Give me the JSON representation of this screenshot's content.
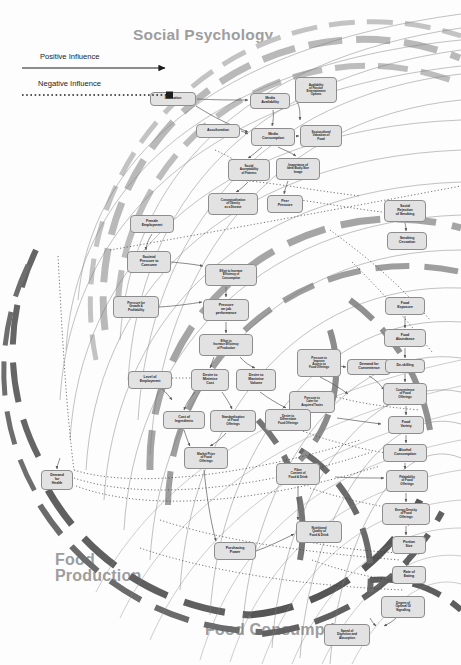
{
  "zones": [
    {
      "id": "social-psychology",
      "label": "Social Psychology"
    },
    {
      "id": "food-production",
      "label": "Food\nProduction"
    },
    {
      "id": "food-consumption",
      "label": "Food Consumption"
    }
  ],
  "zone_labels": {
    "social_psychology": "Social Psychology",
    "food_production_line1": "Food",
    "food_production_line2": "Production",
    "food_consumption": "Food Consumption"
  },
  "legend": {
    "positive_label": "Positive Influence",
    "negative_label": "Negative Influence",
    "positive_style": "solid-arrow",
    "negative_style": "dotted-square",
    "line_color": "#222222"
  },
  "colors": {
    "node_fill": "#e2e2e2",
    "node_stroke": "#8d8d8d",
    "node_text": "#2b2b2b",
    "zone_text": "#9e9e9e",
    "arc_light": "#b7b7b7",
    "arc_mid": "#9a9a9a",
    "arc_dark": "#6e6e6e",
    "link_line": "#6d6d6d",
    "background": "#fdfdfd"
  },
  "nodes": [
    {
      "id": "education",
      "label": "Education",
      "x": 150,
      "y": 92,
      "w": 46,
      "h": 14
    },
    {
      "id": "media-availability",
      "label": "Media\nAvailability",
      "x": 250,
      "y": 93,
      "w": 40,
      "h": 16
    },
    {
      "id": "availability-passive-entertainment",
      "label": "Availability\nof Passive\nEntertainment\nOptions",
      "x": 295,
      "y": 77,
      "w": 42,
      "h": 26
    },
    {
      "id": "acculturation",
      "label": "Acculturation",
      "x": 196,
      "y": 124,
      "w": 44,
      "h": 14
    },
    {
      "id": "media-consumption",
      "label": "Media\nConsumption",
      "x": 251,
      "y": 128,
      "w": 44,
      "h": 18
    },
    {
      "id": "sociocultural-valuation-food",
      "label": "Sociocultural\nValuation of\nFood",
      "x": 300,
      "y": 125,
      "w": 42,
      "h": 22
    },
    {
      "id": "social-acceptability-fatness",
      "label": "Social\nAcceptability\nof Fatness",
      "x": 228,
      "y": 159,
      "w": 42,
      "h": 22
    },
    {
      "id": "importance-ideal-body-size",
      "label": "Importance of\nIdeal Body-Size\nImage",
      "x": 276,
      "y": 158,
      "w": 44,
      "h": 22
    },
    {
      "id": "conceptualisation-obesity-disease",
      "label": "Conceptualisation\nof Obesity\nas a Disease",
      "x": 208,
      "y": 193,
      "w": 50,
      "h": 22
    },
    {
      "id": "peer-pressure",
      "label": "Peer\nPressure",
      "x": 267,
      "y": 195,
      "w": 36,
      "h": 18
    },
    {
      "id": "social-rejection-smoking",
      "label": "Social\nRejection\nof Smoking",
      "x": 384,
      "y": 200,
      "w": 42,
      "h": 22
    },
    {
      "id": "smoking-cessation",
      "label": "Smoking\nCessation",
      "x": 387,
      "y": 232,
      "w": 40,
      "h": 18
    },
    {
      "id": "female-employment",
      "label": "Female\nEmployment",
      "x": 130,
      "y": 215,
      "w": 44,
      "h": 18
    },
    {
      "id": "societal-pressure-consume",
      "label": "Societal\nPressure to\nConsume",
      "x": 127,
      "y": 251,
      "w": 44,
      "h": 22
    },
    {
      "id": "effort-increase-efficiency-consumption",
      "label": "Effort to Increase\nEfficiency of\nConsumption",
      "x": 205,
      "y": 264,
      "w": 52,
      "h": 22
    },
    {
      "id": "pressure-growth-profitability",
      "label": "Pressure for\nGrowth &\nProfitability",
      "x": 113,
      "y": 296,
      "w": 46,
      "h": 22
    },
    {
      "id": "pressure-job-performance",
      "label": "Pressure\non job\nperformance",
      "x": 203,
      "y": 299,
      "w": 46,
      "h": 22
    },
    {
      "id": "effort-increase-efficiency-production",
      "label": "Effort to\nIncrease Efficiency\nof Production",
      "x": 199,
      "y": 334,
      "w": 54,
      "h": 22
    },
    {
      "id": "pressure-improve-access-food",
      "label": "Pressure to\nImprove\nAccess to\nFood Offerings",
      "x": 297,
      "y": 349,
      "w": 44,
      "h": 28
    },
    {
      "id": "demand-convenience",
      "label": "Demand for\nConvenience",
      "x": 347,
      "y": 359,
      "w": 44,
      "h": 16
    },
    {
      "id": "pressure-cater-acquired-tastes",
      "label": "Pressure to\nCater for\nAcquired Tastes",
      "x": 289,
      "y": 391,
      "w": 46,
      "h": 22
    },
    {
      "id": "level-employment",
      "label": "Level of\nEmployment",
      "x": 128,
      "y": 371,
      "w": 44,
      "h": 18
    },
    {
      "id": "desire-minimise-cost",
      "label": "Desire to\nMinimise\nCost",
      "x": 191,
      "y": 369,
      "w": 38,
      "h": 22
    },
    {
      "id": "desire-maximise-volume",
      "label": "Desire to\nMaximise\nVolume",
      "x": 236,
      "y": 369,
      "w": 40,
      "h": 22
    },
    {
      "id": "cost-ingredients",
      "label": "Cost of\nIngredients",
      "x": 163,
      "y": 411,
      "w": 42,
      "h": 18
    },
    {
      "id": "standardisation-food-offerings",
      "label": "Standardisation\nof Food\nOfferings",
      "x": 210,
      "y": 410,
      "w": 46,
      "h": 22
    },
    {
      "id": "desire-differentiate-food-offerings",
      "label": "Desire to\nDifferentiate\nFood Offerings",
      "x": 265,
      "y": 409,
      "w": 46,
      "h": 22
    },
    {
      "id": "market-price-food-offerings",
      "label": "Market Price\nof Food\nOfferings",
      "x": 184,
      "y": 447,
      "w": 44,
      "h": 22
    },
    {
      "id": "fibre-content-food-drink",
      "label": "Fibre\nContent of\nFood & Drink",
      "x": 276,
      "y": 463,
      "w": 44,
      "h": 22
    },
    {
      "id": "demand-health",
      "label": "Demand\nfor\nHealth",
      "x": 41,
      "y": 470,
      "w": 32,
      "h": 20
    },
    {
      "id": "food-exposure",
      "label": "Food\nExposure",
      "x": 385,
      "y": 297,
      "w": 40,
      "h": 18
    },
    {
      "id": "food-abundance",
      "label": "Food\nAbundance",
      "x": 384,
      "y": 329,
      "w": 42,
      "h": 18
    },
    {
      "id": "de-skilling",
      "label": "De-skilling",
      "x": 385,
      "y": 359,
      "w": 40,
      "h": 14
    },
    {
      "id": "convenience-food-offerings",
      "label": "Convenience\nof Food\nOfferings",
      "x": 383,
      "y": 383,
      "w": 44,
      "h": 22
    },
    {
      "id": "food-variety",
      "label": "Food\nVariety",
      "x": 388,
      "y": 416,
      "w": 36,
      "h": 18
    },
    {
      "id": "alcohol-consumption",
      "label": "Alcohol\nConsumption",
      "x": 383,
      "y": 444,
      "w": 44,
      "h": 18
    },
    {
      "id": "palatability-food-offerings",
      "label": "Palatability\nof Food\nOfferings",
      "x": 386,
      "y": 470,
      "w": 42,
      "h": 22
    },
    {
      "id": "energy-density-food-offerings",
      "label": "Energy Density\nof Food\nOfferings",
      "x": 382,
      "y": 503,
      "w": 48,
      "h": 22
    },
    {
      "id": "portion-size",
      "label": "Portion\nSize",
      "x": 392,
      "y": 536,
      "w": 34,
      "h": 18
    },
    {
      "id": "rate-eating",
      "label": "Rate of\nEating",
      "x": 392,
      "y": 566,
      "w": 34,
      "h": 18
    },
    {
      "id": "nutritional-quality-food-drink",
      "label": "Nutritional\nQuality of\nFood & Drink",
      "x": 296,
      "y": 521,
      "w": 46,
      "h": 22
    },
    {
      "id": "purchasing-power",
      "label": "Purchasing\nPower",
      "x": 214,
      "y": 542,
      "w": 42,
      "h": 18
    },
    {
      "id": "degree-optimal-gi-signalling",
      "label": "Degree of\nOptimal GI\nSignalling",
      "x": 381,
      "y": 596,
      "w": 44,
      "h": 22
    },
    {
      "id": "speed-digestion-absorption",
      "label": "Speed of\nDigestion and\nAbsorption",
      "x": 324,
      "y": 624,
      "w": 46,
      "h": 22
    }
  ]
}
